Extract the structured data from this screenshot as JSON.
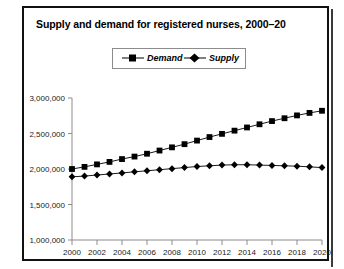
{
  "figure": {
    "title": "Supply and demand for registered nurses, 2000–20",
    "footer_partial": ""
  },
  "legend": {
    "demand_label": "Demand",
    "supply_label": "Supply",
    "position": "top-center"
  },
  "colors": {
    "ink": "#000000",
    "axis": "#8c8c8c",
    "panel_border": "#111111",
    "tick_text": "#222222"
  },
  "chart_data": {
    "type": "line",
    "title": "Supply and demand for registered nurses, 2000–20",
    "xlabel": "",
    "ylabel": "",
    "grid": false,
    "legend_position": "top-center",
    "x": [
      2000,
      2001,
      2002,
      2003,
      2004,
      2005,
      2006,
      2007,
      2008,
      2009,
      2010,
      2011,
      2012,
      2013,
      2014,
      2015,
      2016,
      2017,
      2018,
      2019,
      2020
    ],
    "xlim": [
      2000,
      2020
    ],
    "ylim": [
      1000000,
      3000000
    ],
    "xticks": [
      2000,
      2002,
      2004,
      2006,
      2008,
      2010,
      2012,
      2014,
      2016,
      2018,
      2020
    ],
    "xtick_labels": [
      "2000",
      "2002",
      "2004",
      "2006",
      "2008",
      "2010",
      "2012",
      "2014",
      "2016",
      "2018",
      "2020"
    ],
    "yticks": [
      1000000,
      1500000,
      2000000,
      2500000,
      3000000
    ],
    "ytick_labels": [
      "1,000,000",
      "1,500,000",
      "2,000,000",
      "2,500,000",
      "3,000,000"
    ],
    "series": [
      {
        "name": "Demand",
        "marker": "square",
        "values": [
          2000000,
          2030000,
          2065000,
          2100000,
          2140000,
          2175000,
          2215000,
          2260000,
          2305000,
          2350000,
          2400000,
          2450000,
          2495000,
          2540000,
          2585000,
          2630000,
          2675000,
          2715000,
          2755000,
          2790000,
          2820000
        ]
      },
      {
        "name": "Supply",
        "marker": "diamond",
        "values": [
          1890000,
          1900000,
          1915000,
          1930000,
          1945000,
          1960000,
          1975000,
          1990000,
          2005000,
          2020000,
          2035000,
          2045000,
          2055000,
          2060000,
          2060000,
          2055000,
          2050000,
          2045000,
          2040000,
          2030000,
          2020000
        ]
      }
    ]
  }
}
